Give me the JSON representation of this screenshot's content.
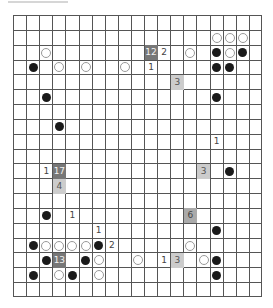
{
  "board": {
    "cols": 19,
    "rows": 19,
    "line_color": "#555555",
    "box_colors": {
      "dark": "#777777",
      "mid": "#aaaaaa",
      "light": "#cccccc"
    }
  },
  "stones": [
    {
      "row": 1,
      "col": 15,
      "color": "white"
    },
    {
      "row": 1,
      "col": 16,
      "color": "white"
    },
    {
      "row": 1,
      "col": 17,
      "color": "white"
    },
    {
      "row": 2,
      "col": 2,
      "color": "white"
    },
    {
      "row": 2,
      "col": 13,
      "color": "white"
    },
    {
      "row": 2,
      "col": 15,
      "color": "black"
    },
    {
      "row": 2,
      "col": 16,
      "color": "white"
    },
    {
      "row": 2,
      "col": 17,
      "color": "black"
    },
    {
      "row": 3,
      "col": 1,
      "color": "black"
    },
    {
      "row": 3,
      "col": 3,
      "color": "white"
    },
    {
      "row": 3,
      "col": 5,
      "color": "white"
    },
    {
      "row": 3,
      "col": 8,
      "color": "white"
    },
    {
      "row": 3,
      "col": 15,
      "color": "black"
    },
    {
      "row": 3,
      "col": 16,
      "color": "black"
    },
    {
      "row": 5,
      "col": 2,
      "color": "black"
    },
    {
      "row": 5,
      "col": 15,
      "color": "black"
    },
    {
      "row": 7,
      "col": 3,
      "color": "black"
    },
    {
      "row": 10,
      "col": 16,
      "color": "black"
    },
    {
      "row": 13,
      "col": 2,
      "color": "black"
    },
    {
      "row": 14,
      "col": 15,
      "color": "black"
    },
    {
      "row": 15,
      "col": 1,
      "color": "black"
    },
    {
      "row": 15,
      "col": 2,
      "color": "white"
    },
    {
      "row": 15,
      "col": 3,
      "color": "white"
    },
    {
      "row": 15,
      "col": 4,
      "color": "white"
    },
    {
      "row": 15,
      "col": 5,
      "color": "white"
    },
    {
      "row": 15,
      "col": 6,
      "color": "black"
    },
    {
      "row": 15,
      "col": 13,
      "color": "white"
    },
    {
      "row": 16,
      "col": 2,
      "color": "black"
    },
    {
      "row": 16,
      "col": 5,
      "color": "black"
    },
    {
      "row": 16,
      "col": 6,
      "color": "white"
    },
    {
      "row": 16,
      "col": 9,
      "color": "white"
    },
    {
      "row": 16,
      "col": 14,
      "color": "white"
    },
    {
      "row": 16,
      "col": 15,
      "color": "black"
    },
    {
      "row": 17,
      "col": 1,
      "color": "black"
    },
    {
      "row": 17,
      "col": 3,
      "color": "white"
    },
    {
      "row": 17,
      "col": 4,
      "color": "black"
    },
    {
      "row": 17,
      "col": 6,
      "color": "white"
    },
    {
      "row": 17,
      "col": 15,
      "color": "black"
    }
  ],
  "numbers": [
    {
      "row": 2,
      "col": 11,
      "value": "2"
    },
    {
      "row": 3,
      "col": 10,
      "value": "1"
    },
    {
      "row": 8,
      "col": 15,
      "value": "1"
    },
    {
      "row": 10,
      "col": 2,
      "value": "1"
    },
    {
      "row": 13,
      "col": 4,
      "value": "1"
    },
    {
      "row": 14,
      "col": 6,
      "value": "1"
    },
    {
      "row": 15,
      "col": 7,
      "value": "2"
    },
    {
      "row": 16,
      "col": 11,
      "value": "1"
    }
  ],
  "boxes": [
    {
      "row": 2,
      "col": 10,
      "value": "12",
      "shade": "dark"
    },
    {
      "row": 4,
      "col": 12,
      "value": "3",
      "shade": "light"
    },
    {
      "row": 10,
      "col": 3,
      "value": "17",
      "shade": "dark"
    },
    {
      "row": 10,
      "col": 14,
      "value": "3",
      "shade": "light"
    },
    {
      "row": 11,
      "col": 3,
      "value": "4",
      "shade": "light"
    },
    {
      "row": 13,
      "col": 13,
      "value": "6",
      "shade": "mid"
    },
    {
      "row": 16,
      "col": 3,
      "value": "13",
      "shade": "dark"
    },
    {
      "row": 16,
      "col": 12,
      "value": "3",
      "shade": "light"
    }
  ]
}
